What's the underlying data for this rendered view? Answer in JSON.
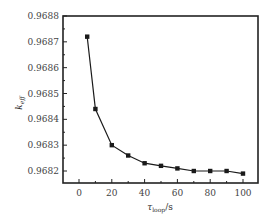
{
  "chart_data": {
    "type": "line",
    "title": "",
    "xlabel": "τ_loop / s",
    "ylabel": "k_eff",
    "xlabel_main": "τ",
    "xlabel_sub": "loop",
    "xlabel_unit": "/s",
    "ylabel_main": "k",
    "ylabel_sub": "eff",
    "xlim": [
      -10,
      110
    ],
    "ylim": [
      0.96815,
      0.9688
    ],
    "xticks": [
      0,
      20,
      40,
      60,
      80,
      100
    ],
    "xtick_labels": [
      "0",
      "20",
      "40",
      "60",
      "80",
      "100"
    ],
    "yticks": [
      0.9682,
      0.9683,
      0.9684,
      0.9685,
      0.9686,
      0.9687,
      0.9688
    ],
    "ytick_labels": [
      "0.9682",
      "0.9683",
      "0.9684",
      "0.9685",
      "0.9686",
      "0.9687",
      "0.9688"
    ],
    "grid": false,
    "legend": null,
    "marker": "square",
    "color": "#1a1a1a",
    "series": [
      {
        "name": "k_eff",
        "x": [
          5,
          10,
          20,
          30,
          40,
          50,
          60,
          70,
          80,
          90,
          100
        ],
        "values": [
          0.96872,
          0.96844,
          0.9683,
          0.96826,
          0.96823,
          0.96822,
          0.96821,
          0.9682,
          0.9682,
          0.9682,
          0.96819
        ]
      }
    ]
  }
}
